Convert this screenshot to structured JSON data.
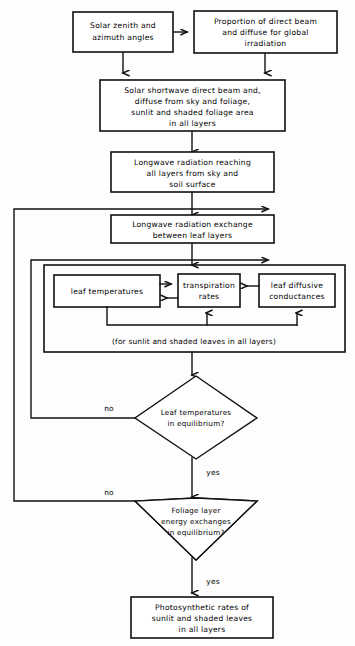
{
  "diagram": {
    "background_color": "#fdfdfd",
    "line_color": "#111111",
    "box_fill": "#ffffff"
  },
  "nodes": {
    "solar_angles": {
      "id": "solar-zenith-azimuth",
      "shape": "rect",
      "lines": [
        "Solar zenith and",
        "azimuth angles"
      ]
    },
    "proportion_direct": {
      "id": "proportion-direct-diffuse",
      "shape": "rect",
      "lines": [
        "Proportion of direct beam",
        "and diffuse for global",
        "irradiation"
      ]
    },
    "shortwave": {
      "id": "solar-shortwave",
      "shape": "rect",
      "lines": [
        "Solar shortwave direct beam and,",
        "diffuse from sky and foliage,",
        "sunlit and shaded foliage area",
        "in all layers"
      ]
    },
    "longwave_reaching": {
      "id": "longwave-radiation-reaching",
      "shape": "rect",
      "lines": [
        "Longwave radiation reaching",
        "all layers from sky and",
        "soil surface"
      ]
    },
    "longwave_exchange": {
      "id": "longwave-radiation-exchange",
      "shape": "rect",
      "lines": [
        "Longwave radiation exchange",
        "between leaf layers"
      ]
    },
    "leaf_temperatures": {
      "id": "leaf-temperatures",
      "shape": "rect",
      "lines": [
        "leaf temperatures"
      ]
    },
    "transpiration_rates": {
      "id": "transpiration-rates",
      "shape": "rect",
      "lines": [
        "transpiration",
        "rates"
      ]
    },
    "leaf_conductances": {
      "id": "leaf-diffusive-conductances",
      "shape": "rect",
      "lines": [
        "leaf diffusive",
        "conductances"
      ]
    },
    "leaf_group_caption": {
      "id": "sunlit-shaded-caption",
      "shape": "caption",
      "lines": [
        "(for sunlit and shaded leaves in all layers)"
      ]
    },
    "decision_leaf_temp": {
      "id": "leaf-temperatures-equilibrium",
      "shape": "diamond",
      "lines": [
        "Leaf temperatures",
        "in equilibrium?"
      ]
    },
    "decision_foliage": {
      "id": "foliage-layer-energy-equilibrium",
      "shape": "diamond",
      "lines": [
        "Foliage layer",
        "energy exchanges",
        "in equilibrium?"
      ]
    },
    "photosynthetic": {
      "id": "photosynthetic-rates",
      "shape": "rect",
      "lines": [
        "Photosynthetic rates of",
        "sunlit and shaded leaves",
        "in all layers"
      ]
    }
  },
  "edge_labels": {
    "no_1": "no",
    "no_2": "no",
    "yes_1": "yes",
    "yes_2": "yes"
  },
  "flow": {
    "edges": [
      {
        "from": "solar_angles",
        "to": "proportion_direct",
        "label": ""
      },
      {
        "from": "solar_angles",
        "to": "shortwave",
        "label": ""
      },
      {
        "from": "proportion_direct",
        "to": "shortwave",
        "label": ""
      },
      {
        "from": "shortwave",
        "to": "longwave_reaching",
        "label": ""
      },
      {
        "from": "longwave_reaching",
        "to": "longwave_exchange",
        "label": ""
      },
      {
        "from": "longwave_exchange",
        "to": "leaf_group",
        "label": ""
      },
      {
        "from": "leaf_group",
        "to": "decision_leaf_temp",
        "label": ""
      },
      {
        "from": "decision_leaf_temp",
        "to": "leaf_group",
        "label": "no"
      },
      {
        "from": "decision_leaf_temp",
        "to": "decision_foliage",
        "label": "yes"
      },
      {
        "from": "decision_foliage",
        "to": "longwave_exchange",
        "label": "no"
      },
      {
        "from": "decision_foliage",
        "to": "photosynthetic",
        "label": "yes"
      },
      {
        "from": "leaf_temperatures",
        "to": "transpiration_rates",
        "label": ""
      },
      {
        "from": "transpiration_rates",
        "to": "leaf_temperatures",
        "label": ""
      },
      {
        "from": "leaf_conductances",
        "to": "transpiration_rates",
        "label": ""
      }
    ]
  }
}
